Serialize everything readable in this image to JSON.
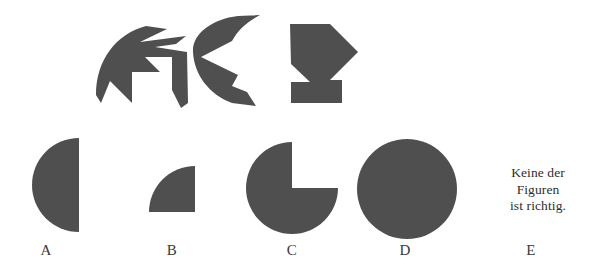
{
  "page": {
    "width": 593,
    "height": 269,
    "background_color": "#ffffff",
    "kind": "mental-rotation / paper-folding multiple-choice item"
  },
  "palette": {
    "figure_fill": "#4f4f4f",
    "text_color": "#2e2e2e",
    "label_color": "#3a3a3a",
    "background": "#ffffff"
  },
  "stimulus": {
    "name": "top-row-fragments",
    "count": 3,
    "pieces": [
      {
        "id": "fragment-1",
        "label": "arrow-wedge-left-fragment"
      },
      {
        "id": "fragment-2",
        "label": "crescent-chevron-fragment"
      },
      {
        "id": "fragment-3",
        "label": "pentagon-arrow-notch-fragment"
      }
    ]
  },
  "options": {
    "items": [
      {
        "key": "A",
        "label": "A",
        "shape": "left-half-circle"
      },
      {
        "key": "B",
        "label": "B",
        "shape": "quarter-circle"
      },
      {
        "key": "C",
        "label": "C",
        "shape": "circle-with-quarter-notch"
      },
      {
        "key": "D",
        "label": "D",
        "shape": "full-circle"
      },
      {
        "key": "E",
        "label": "E",
        "shape": "none-of-the-above-text"
      }
    ]
  },
  "none_option": {
    "line1": "Keine der",
    "line2": "Figuren",
    "line3": "ist richtig."
  }
}
